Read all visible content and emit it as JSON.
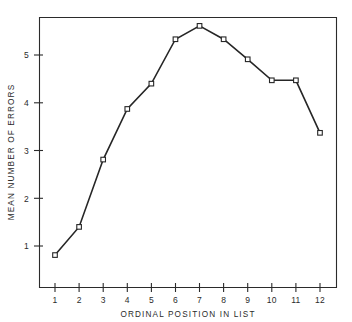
{
  "chart_data": {
    "type": "line",
    "title": "",
    "subtitle": "",
    "xlabel": "ORDINAL POSITION IN LIST",
    "ylabel": "MEAN NUMBER OF ERRORS",
    "categories": [
      "1",
      "2",
      "3",
      "4",
      "5",
      "6",
      "7",
      "8",
      "9",
      "10",
      "11",
      "12"
    ],
    "x": [
      1,
      2,
      3,
      4,
      5,
      6,
      7,
      8,
      9,
      10,
      11,
      12
    ],
    "values": [
      0.81,
      1.4,
      2.81,
      3.87,
      4.4,
      5.33,
      5.61,
      5.33,
      4.91,
      4.47,
      4.47,
      3.37
    ],
    "xtick_labels": [
      "1",
      "2",
      "3",
      "4",
      "5",
      "6",
      "7",
      "8",
      "9",
      "10",
      "11",
      "12"
    ],
    "ytick_labels": [
      "1",
      "2",
      "3",
      "4",
      "5"
    ],
    "ytick_values": [
      1,
      2,
      3,
      4,
      5
    ],
    "xlim": [
      0.5,
      12.6
    ],
    "ylim": [
      0.0,
      6.05
    ],
    "grid": false,
    "legend": false,
    "legend_position": "none",
    "marker": "open-square",
    "line_color": "#262626",
    "marker_fill": "#ffffff",
    "marker_stroke": "#262626",
    "background_color": "#ffffff",
    "axis_color": "#2b2b2b"
  }
}
